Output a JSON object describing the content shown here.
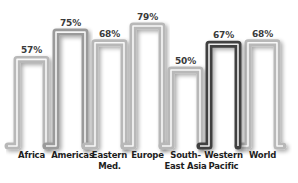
{
  "chart_data": {
    "type": "bar",
    "style": "continuous tube line forming inverted-U bars",
    "title": "",
    "xlabel": "",
    "ylabel": "",
    "categories": [
      "Africa",
      "Americas",
      "Eastern\nMed.",
      "Europe",
      "South-\nEast Asia",
      "Western\nPacific",
      "World"
    ],
    "values": [
      57,
      75,
      68,
      79,
      50,
      67,
      68
    ],
    "value_labels": [
      "57%",
      "75%",
      "68%",
      "79%",
      "50%",
      "67%",
      "68%"
    ],
    "highlighted_category": "Western Pacific",
    "colors": {
      "default": "#b8b8b8",
      "highlight": "#404040",
      "americas": "#9a9a9a",
      "inner_stripe": "#ffffff"
    },
    "grid": false,
    "legend": false,
    "ylim": [
      0,
      100
    ]
  }
}
